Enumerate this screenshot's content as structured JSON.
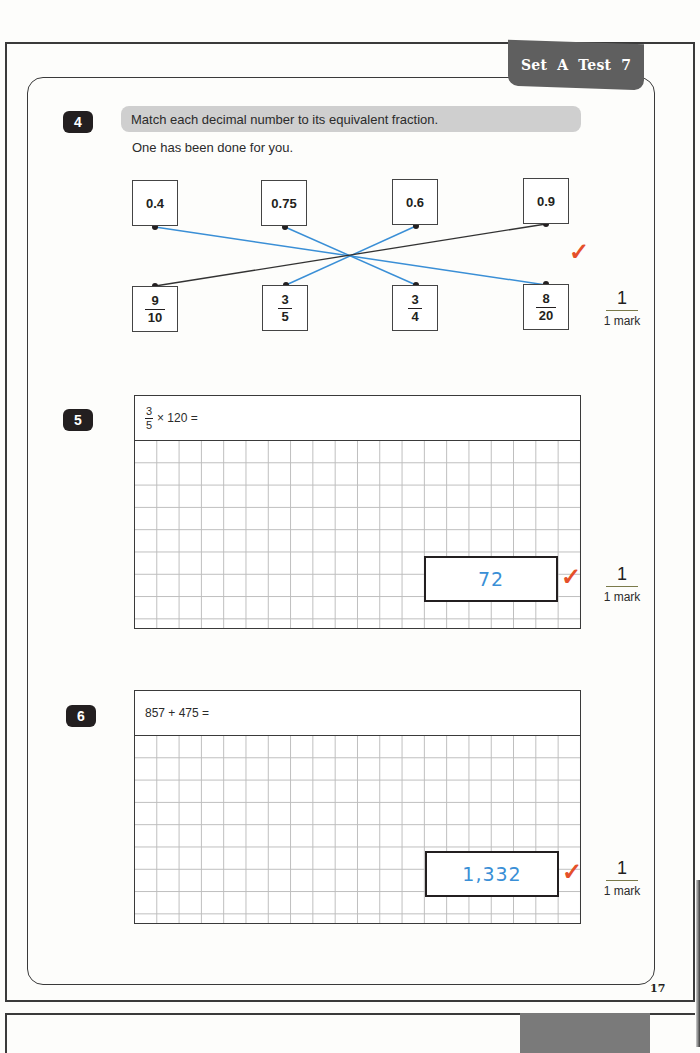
{
  "header": {
    "set_tab": "Set A  Test 7"
  },
  "page_number": "17",
  "questions": [
    {
      "number": "4",
      "instruction": "Match each decimal number to its equivalent fraction.",
      "subtext": "One has been done for you.",
      "decimals": [
        "0.4",
        "0.75",
        "0.6",
        "0.9"
      ],
      "fractions": [
        {
          "num": "9",
          "den": "10"
        },
        {
          "num": "3",
          "den": "5"
        },
        {
          "num": "3",
          "den": "4"
        },
        {
          "num": "8",
          "den": "20"
        }
      ],
      "matches": [
        {
          "from": "0.4",
          "to": "8/20",
          "color": "#3a8fd6"
        },
        {
          "from": "0.75",
          "to": "3/4",
          "color": "#3a8fd6"
        },
        {
          "from": "0.6",
          "to": "3/5",
          "color": "#3a8fd6"
        },
        {
          "from": "0.9",
          "to": "9/10",
          "color": "#333333",
          "example": true
        }
      ],
      "tick": "✓",
      "mark": {
        "score": "1",
        "label": "1 mark"
      }
    },
    {
      "number": "5",
      "prompt_fraction": {
        "num": "3",
        "den": "5"
      },
      "prompt_rest": "× 120 =",
      "answer": "72",
      "tick": "✓",
      "mark": {
        "score": "1",
        "label": "1 mark"
      }
    },
    {
      "number": "6",
      "prompt": "857 + 475 =",
      "answer": "1,332",
      "tick": "✓",
      "mark": {
        "score": "1",
        "label": "1 mark"
      }
    }
  ],
  "colors": {
    "answer_ink": "#3a8fd6",
    "tick_ink": "#e5502a",
    "tab_bg": "#5f5f5f",
    "instruction_bg": "#cfcfcf"
  }
}
